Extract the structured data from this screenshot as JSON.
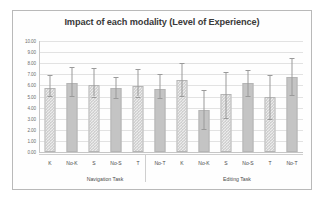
{
  "chart_data": {
    "type": "bar",
    "title": "Impact of each modality (Level of Experience)",
    "xlabel": "",
    "ylabel": "",
    "ylim": [
      0,
      10
    ],
    "ytick_step": 1,
    "ytick_labels": [
      "10.00",
      "9.00",
      "8.00",
      "7.00",
      "6.00",
      "5.00",
      "4.00",
      "3.00",
      "2.00",
      "1.00",
      "0.00"
    ],
    "grid": true,
    "legend": "none",
    "categories": [
      "K",
      "No-K",
      "S",
      "No-S",
      "T",
      "No-T",
      "K",
      "No-K",
      "S",
      "No-S",
      "T",
      "No-T"
    ],
    "groups": [
      {
        "label": "Navigation Task",
        "start": 0,
        "count": 6
      },
      {
        "label": "Editing Task",
        "start": 6,
        "count": 6
      }
    ],
    "values": [
      5.75,
      6.25,
      6.0,
      5.75,
      5.95,
      5.7,
      6.5,
      3.75,
      5.25,
      6.2,
      4.95,
      6.75
    ],
    "error_upper": [
      6.9,
      7.7,
      7.55,
      6.8,
      7.45,
      7.05,
      8.0,
      5.6,
      7.2,
      7.4,
      6.9,
      8.45
    ],
    "error_lower": [
      5.05,
      5.05,
      5.0,
      4.85,
      5.0,
      4.9,
      5.05,
      2.05,
      3.05,
      5.05,
      3.0,
      5.1
    ],
    "bar_patterns": [
      "check",
      "solid",
      "check",
      "solid",
      "check",
      "solid",
      "check",
      "solid",
      "check",
      "solid",
      "check",
      "solid"
    ],
    "colors": {
      "bar_check_fill": "#ececec",
      "bar_check_hatch": "#c2c2c2",
      "bar_solid_fill": "#c4c4c4",
      "bar_border": "#b5b5b5",
      "error_bar": "#9a9a9a",
      "gridline": "#e2e2e2",
      "axis": "#c6c6c6",
      "title_text": "#3a3a3a",
      "tick_text": "#6d6d6d",
      "frame": "#b9b9b9",
      "background": "#fefefe"
    }
  }
}
